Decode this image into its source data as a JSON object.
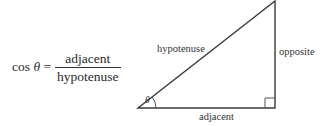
{
  "formula": {
    "function": "cos",
    "variable": "θ",
    "equals": "=",
    "numerator": "adjacent",
    "denominator": "hypotenuse"
  },
  "triangle": {
    "labels": {
      "hypotenuse": "hypotenuse",
      "opposite": "opposite",
      "adjacent": "adjacent",
      "angle": "θ"
    },
    "vertices": {
      "angle_vertex": [
        138,
        108
      ],
      "right_angle_vertex": [
        275,
        108
      ],
      "top_vertex": [
        275,
        0
      ]
    },
    "stroke_color": "#3a3a3a"
  }
}
